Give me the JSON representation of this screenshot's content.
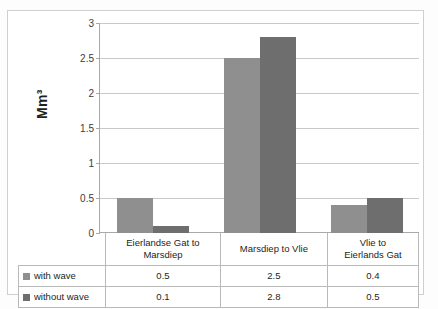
{
  "chart_data": {
    "type": "bar",
    "title": "",
    "xlabel": "",
    "ylabel": "Mm³",
    "ylim": [
      0,
      3
    ],
    "yticks": [
      "0",
      "0.5",
      "1",
      "1.5",
      "2",
      "2.5",
      "3"
    ],
    "grid": true,
    "legend_position": "data-table",
    "categories": [
      "Eierlandse Gat to Marsdiep",
      "Marsdiep to Vlie",
      "Vlie to Eierlands Gat"
    ],
    "category_lines": [
      [
        "Eierlandse Gat to",
        "Marsdiep"
      ],
      [
        "Marsdiep to Vlie"
      ],
      [
        "Vlie to",
        "Eierlands Gat"
      ]
    ],
    "series": [
      {
        "name": "with wave",
        "color": "#8f8f8f",
        "values": [
          0.5,
          2.5,
          0.4
        ],
        "labels": [
          "0.5",
          "2.5",
          "0.4"
        ]
      },
      {
        "name": "without  wave",
        "color": "#6e6e6e",
        "values": [
          0.1,
          2.8,
          0.5
        ],
        "labels": [
          "0.1",
          "2.8",
          "0.5"
        ]
      }
    ]
  }
}
